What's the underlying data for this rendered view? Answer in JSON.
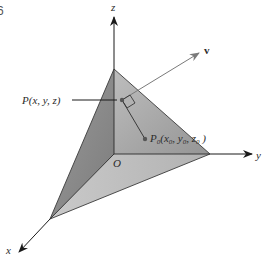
{
  "figure": {
    "corner_number": "6",
    "labels": {
      "z_axis": "z",
      "y_axis": "y",
      "x_axis": "x",
      "origin": "O",
      "vector": "v",
      "point_p": "P(x, y, z)",
      "point_p0_prefix": "P",
      "point_p0_sub": "0",
      "point_p0_args": "(x",
      "point_p0_x_sub": "0",
      "point_p0_comma1": ", y",
      "point_p0_y_sub": "0",
      "point_p0_comma2": ", z",
      "point_p0_z_sub": "0",
      "point_p0_close": " )"
    },
    "colors": {
      "left_face": "#8a8a8a",
      "right_face": "#a6a6a6",
      "bottom_face": "#c4c4c4",
      "axis": "#1a1a1a",
      "vector": "#7a7a7a"
    }
  }
}
